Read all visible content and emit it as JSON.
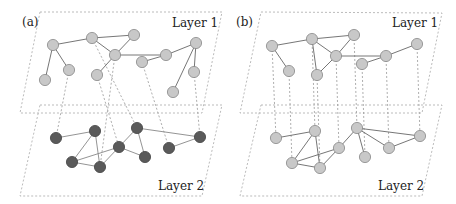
{
  "colors": {
    "light_node_fill": "#c8c8c8",
    "light_node_stroke": "#888888",
    "dark_node_fill": "#5a5a5a",
    "dark_node_stroke": "#444444"
  },
  "panels": [
    {
      "label": "(a)",
      "label_pos": [
        22,
        26
      ],
      "layer1": {
        "label": "Layer 1",
        "label_pos": [
          172,
          27
        ],
        "plane": [
          [
            40,
            12
          ],
          [
            222,
            12
          ],
          [
            202,
            113
          ],
          [
            20,
            113
          ]
        ],
        "node_style": "light",
        "nodes": {
          "A": [
            53,
            45
          ],
          "B": [
            92,
            38
          ],
          "C": [
            134,
            35
          ],
          "D": [
            115,
            55
          ],
          "E": [
            69,
            70
          ],
          "F": [
            45,
            80
          ],
          "G": [
            97,
            75
          ],
          "H": [
            142,
            62
          ],
          "I": [
            166,
            55
          ],
          "J": [
            196,
            43
          ],
          "K": [
            194,
            72
          ],
          "L": [
            173,
            92
          ]
        },
        "edges": [
          [
            "A",
            "B"
          ],
          [
            "A",
            "E"
          ],
          [
            "A",
            "F"
          ],
          [
            "B",
            "C"
          ],
          [
            "B",
            "D"
          ],
          [
            "C",
            "D"
          ],
          [
            "D",
            "G"
          ],
          [
            "D",
            "I"
          ],
          [
            "H",
            "I"
          ],
          [
            "I",
            "J"
          ],
          [
            "J",
            "K"
          ],
          [
            "J",
            "L"
          ]
        ]
      },
      "layer2": {
        "label": "Layer 2",
        "label_pos": [
          158,
          190
        ],
        "plane": [
          [
            40,
            105
          ],
          [
            222,
            105
          ],
          [
            202,
            196
          ],
          [
            20,
            196
          ]
        ],
        "node_style": "dark",
        "nodes": {
          "P": [
            56,
            138
          ],
          "Q": [
            95,
            131
          ],
          "R": [
            72,
            162
          ],
          "S": [
            100,
            167
          ],
          "T": [
            119,
            147
          ],
          "U": [
            137,
            128
          ],
          "V": [
            145,
            157
          ],
          "W": [
            169,
            148
          ],
          "X": [
            200,
            137
          ]
        },
        "edges": [
          [
            "P",
            "Q"
          ],
          [
            "Q",
            "R"
          ],
          [
            "Q",
            "S"
          ],
          [
            "R",
            "S"
          ],
          [
            "R",
            "T"
          ],
          [
            "T",
            "U"
          ],
          [
            "S",
            "T"
          ],
          [
            "U",
            "V"
          ],
          [
            "U",
            "X"
          ],
          [
            "W",
            "X"
          ],
          [
            "T",
            "V"
          ]
        ]
      },
      "interlayer": [
        [
          [
            69,
            70
          ],
          [
            56,
            138
          ]
        ],
        [
          [
            115,
            55
          ],
          [
            100,
            167
          ]
        ],
        [
          [
            92,
            38
          ],
          [
            137,
            128
          ]
        ],
        [
          [
            97,
            75
          ],
          [
            119,
            147
          ]
        ],
        [
          [
            142,
            62
          ],
          [
            169,
            148
          ]
        ],
        [
          [
            194,
            72
          ],
          [
            200,
            137
          ]
        ]
      ]
    },
    {
      "label": "(b)",
      "label_pos": [
        236,
        26
      ],
      "layer1": {
        "label": "Layer 1",
        "label_pos": [
          392,
          27
        ],
        "plane": [
          [
            261,
            12
          ],
          [
            442,
            13
          ],
          [
            422,
            113
          ],
          [
            240,
            113
          ]
        ],
        "node_style": "light",
        "nodes": {
          "a": [
            272,
            46
          ],
          "b": [
            312,
            39
          ],
          "c": [
            354,
            35
          ],
          "d": [
            336,
            56
          ],
          "e": [
            289,
            71
          ],
          "f": [
            317,
            75
          ],
          "g": [
            362,
            64
          ],
          "h": [
            386,
            56
          ],
          "i": [
            417,
            44
          ]
        },
        "edges": [
          [
            "a",
            "b"
          ],
          [
            "a",
            "e"
          ],
          [
            "b",
            "c"
          ],
          [
            "b",
            "d"
          ],
          [
            "b",
            "f"
          ],
          [
            "c",
            "d"
          ],
          [
            "d",
            "f"
          ],
          [
            "d",
            "h"
          ],
          [
            "g",
            "h"
          ],
          [
            "h",
            "i"
          ]
        ]
      },
      "layer2": {
        "label": "Layer 2",
        "label_pos": [
          378,
          190
        ],
        "plane": [
          [
            261,
            105
          ],
          [
            442,
            105
          ],
          [
            422,
            196
          ],
          [
            240,
            196
          ]
        ],
        "node_style": "light",
        "nodes": {
          "p": [
            276,
            138
          ],
          "q": [
            315,
            131
          ],
          "r": [
            292,
            163
          ],
          "s": [
            320,
            168
          ],
          "t": [
            339,
            148
          ],
          "u": [
            357,
            128
          ],
          "v": [
            365,
            157
          ],
          "w": [
            389,
            148
          ],
          "x": [
            420,
            136
          ]
        },
        "edges": [
          [
            "p",
            "q"
          ],
          [
            "q",
            "r"
          ],
          [
            "q",
            "s"
          ],
          [
            "r",
            "s"
          ],
          [
            "r",
            "t"
          ],
          [
            "s",
            "t"
          ],
          [
            "t",
            "u"
          ],
          [
            "u",
            "v"
          ],
          [
            "u",
            "x"
          ],
          [
            "u",
            "w"
          ],
          [
            "w",
            "x"
          ]
        ]
      },
      "interlayer": [
        [
          [
            272,
            46
          ],
          [
            276,
            138
          ]
        ],
        [
          [
            289,
            71
          ],
          [
            292,
            163
          ]
        ],
        [
          [
            312,
            39
          ],
          [
            315,
            131
          ]
        ],
        [
          [
            317,
            75
          ],
          [
            320,
            168
          ]
        ],
        [
          [
            336,
            56
          ],
          [
            339,
            148
          ]
        ],
        [
          [
            354,
            35
          ],
          [
            357,
            128
          ]
        ],
        [
          [
            362,
            64
          ],
          [
            365,
            157
          ]
        ],
        [
          [
            386,
            56
          ],
          [
            389,
            148
          ]
        ],
        [
          [
            417,
            44
          ],
          [
            420,
            136
          ]
        ]
      ]
    }
  ]
}
